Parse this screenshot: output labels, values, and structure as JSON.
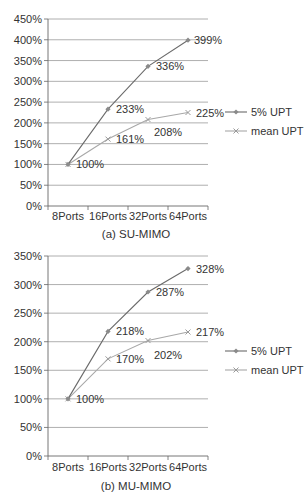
{
  "chart_data": [
    {
      "type": "line",
      "title": "(a) SU-MIMO",
      "xlabel": "",
      "ylabel": "",
      "categories": [
        "8Ports",
        "16Ports",
        "32Ports",
        "64Ports"
      ],
      "yticks": [
        "0%",
        "50%",
        "100%",
        "150%",
        "200%",
        "250%",
        "300%",
        "350%",
        "400%",
        "450%"
      ],
      "ylim": [
        0,
        450
      ],
      "grid": true,
      "legend_position": "right",
      "series": [
        {
          "name": "5% UPT",
          "values": [
            100,
            233,
            336,
            399
          ],
          "labels": [
            "100%",
            "233%",
            "336%",
            "399%"
          ],
          "marker": "diamond",
          "color": "#6b6b6b"
        },
        {
          "name": "mean UPT",
          "values": [
            100,
            161,
            208,
            225
          ],
          "labels": [
            "",
            "161%",
            "208%",
            "225%"
          ],
          "marker": "x",
          "color": "#a8a8a8"
        }
      ]
    },
    {
      "type": "line",
      "title": "(b) MU-MIMO",
      "xlabel": "",
      "ylabel": "",
      "categories": [
        "8Ports",
        "16Ports",
        "32Ports",
        "64Ports"
      ],
      "yticks": [
        "0%",
        "50%",
        "100%",
        "150%",
        "200%",
        "250%",
        "300%",
        "350%"
      ],
      "ylim": [
        0,
        350
      ],
      "grid": true,
      "legend_position": "right",
      "series": [
        {
          "name": "5% UPT",
          "values": [
            100,
            218,
            287,
            328
          ],
          "labels": [
            "100%",
            "218%",
            "287%",
            "328%"
          ],
          "marker": "diamond",
          "color": "#6b6b6b"
        },
        {
          "name": "mean UPT",
          "values": [
            100,
            170,
            202,
            217
          ],
          "labels": [
            "",
            "170%",
            "202%",
            "217%"
          ],
          "marker": "x",
          "color": "#a8a8a8"
        }
      ]
    }
  ],
  "charts": [
    {
      "caption": "(a) SU-MIMO",
      "legend": [
        "5% UPT",
        "mean UPT"
      ]
    },
    {
      "caption": "(b) MU-MIMO",
      "legend": [
        "5% UPT",
        "mean UPT"
      ]
    }
  ]
}
